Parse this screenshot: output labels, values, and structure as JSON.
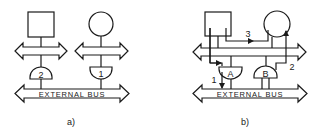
{
  "diagrams": [
    {
      "id": "a",
      "caption": "a)",
      "external_bus_label": "EXTERNAL BUS",
      "gates": [
        {
          "label": "2",
          "shape": "dome-up"
        },
        {
          "label": "1",
          "shape": "dome-down"
        }
      ],
      "nodes": [
        {
          "shape": "square"
        },
        {
          "shape": "circle"
        }
      ],
      "internal_buses": 2
    },
    {
      "id": "b",
      "caption": "b)",
      "external_bus_label": "EXTERNAL BUS",
      "gates": [
        {
          "label": "A",
          "shape": "dome-down"
        },
        {
          "label": "B",
          "shape": "dome-up"
        }
      ],
      "nodes": [
        {
          "shape": "square"
        },
        {
          "shape": "circle"
        }
      ],
      "internal_buses": 1,
      "paths": [
        {
          "label": "1",
          "description": "square to external bus via gate A"
        },
        {
          "label": "2",
          "description": "external bus via gate B up to circle"
        },
        {
          "label": "3",
          "description": "square directly to circle"
        }
      ]
    }
  ],
  "colors": {
    "line": "#1a1a1a",
    "background": "#ffffff"
  }
}
